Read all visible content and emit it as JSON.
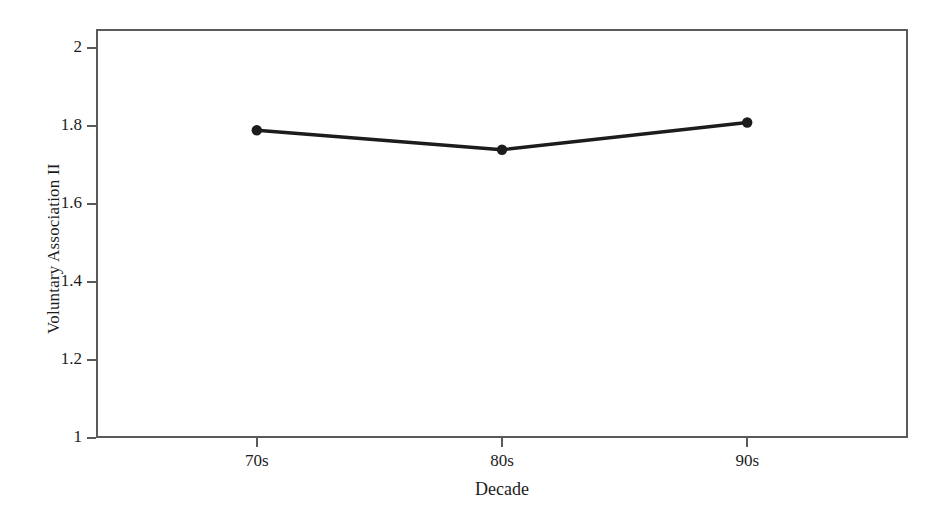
{
  "chart_data": {
    "type": "line",
    "title": "",
    "subtitle": "",
    "xlabel": "Decade",
    "ylabel": "Voluntary Association II",
    "categories": [
      "70s",
      "80s",
      "90s"
    ],
    "values": [
      1.79,
      1.74,
      1.81
    ],
    "series": [
      {
        "name": "Voluntary Association II",
        "values": [
          1.79,
          1.74,
          1.81
        ]
      }
    ],
    "ylim": [
      1,
      2.05
    ],
    "xlim": [
      0,
      1
    ],
    "y_ticks": [
      "1",
      "1.2",
      "1.4",
      "1.6",
      "1.8",
      "2"
    ],
    "y_tick_values": [
      1,
      1.2,
      1.4,
      1.6,
      1.8,
      2
    ],
    "x_ticks": [
      "70s",
      "80s",
      "90s"
    ],
    "grid": false,
    "legend": false,
    "legend_position": "none",
    "annotations": [],
    "marker": "filled-circle",
    "line_color": "#1c1c1c",
    "marker_color": "#1c1c1c",
    "frame_color": "#5a5a5a",
    "background_color": "#ffffff"
  },
  "axes": {
    "y": {
      "label": "Voluntary Association II",
      "ticks": [
        {
          "label": "2",
          "value": 2
        },
        {
          "label": "1.8",
          "value": 1.8
        },
        {
          "label": "1.6",
          "value": 1.6
        },
        {
          "label": "1.4",
          "value": 1.4
        },
        {
          "label": "1.2",
          "value": 1.2
        },
        {
          "label": "1",
          "value": 1
        }
      ]
    },
    "x": {
      "label": "Decade",
      "ticks": [
        {
          "label": "70s"
        },
        {
          "label": "80s"
        },
        {
          "label": "90s"
        }
      ]
    }
  }
}
